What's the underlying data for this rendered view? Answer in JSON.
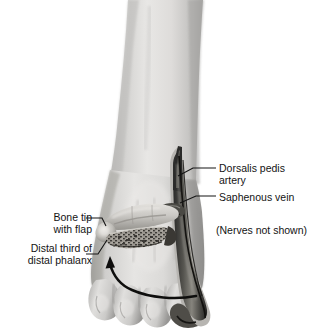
{
  "figure": {
    "background_color": "#ffffff",
    "ink_color": "#141414"
  },
  "labels": {
    "dorsalis_pedis_artery": "Dorsalis pedis\nartery",
    "saphenous_vein": "Saphenous vein",
    "nerves_note": "(Nerves not shown)",
    "bone_tip_with_flap": "Bone tip\nwith flap",
    "distal_third_of_distal_phalanx": "Distal third of\ndistal phalanx"
  },
  "anatomy": {
    "leg": "lower-leg-shaft",
    "foot": "foot-dorsum",
    "toes": [
      "toe-1",
      "toe-2",
      "toe-3",
      "toe-4"
    ],
    "pedicle": "vascular-pedicle-strip",
    "bone_graft": "distal-phalanx-bone-segment",
    "flap": "skin-flap-with-bone-tip",
    "arrow": "transfer-direction-arrow"
  },
  "colors": {
    "skin_light": "#e9e8e6",
    "skin_mid": "#c9c8c6",
    "skin_dark": "#9b9a98",
    "shadow": "#6f6e6c",
    "tissue_dark": "#3a3a39",
    "tissue_darkest": "#1d1d1c",
    "bone": "#dcdad6",
    "leader": "#141414"
  }
}
